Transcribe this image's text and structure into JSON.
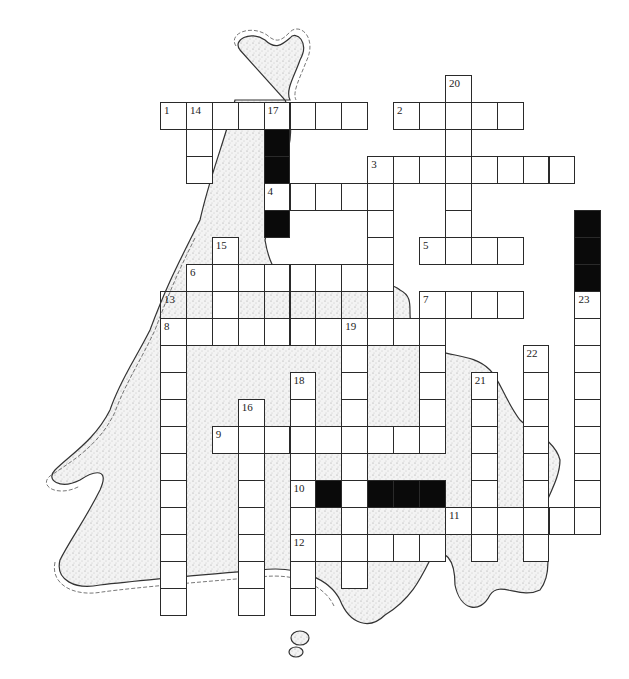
{
  "puzzle": {
    "title": "",
    "grid_origin": {
      "x": 160,
      "y": 75
    },
    "cell_w": 25.9,
    "cell_h": 27,
    "colors": {
      "line": "#2a2a2a",
      "fill": "#ffffff",
      "block": "#0a0a0a",
      "land_stipple": "#8a8a8a",
      "coast": "#333333"
    },
    "entries": [
      {
        "num": "1",
        "dir": "across",
        "r": 1,
        "c": 0,
        "len": 8
      },
      {
        "num": "2",
        "dir": "across",
        "r": 1,
        "c": 9,
        "len": 5
      },
      {
        "num": "3",
        "dir": "across",
        "r": 3,
        "c": 8,
        "len": 8
      },
      {
        "num": "4",
        "dir": "across",
        "r": 4,
        "c": 4,
        "len": 5
      },
      {
        "num": "5",
        "dir": "across",
        "r": 6,
        "c": 10,
        "len": 4
      },
      {
        "num": "6",
        "dir": "across",
        "r": 7,
        "c": 1,
        "len": 8
      },
      {
        "num": "7",
        "dir": "across",
        "r": 8,
        "c": 10,
        "len": 4
      },
      {
        "num": "8",
        "dir": "across",
        "r": 9,
        "c": 0,
        "len": 11
      },
      {
        "num": "9",
        "dir": "across",
        "r": 13,
        "c": 2,
        "len": 9
      },
      {
        "num": "10",
        "dir": "across",
        "r": 15,
        "c": 5,
        "len": 1
      },
      {
        "num": "11",
        "dir": "across",
        "r": 16,
        "c": 11,
        "len": 6
      },
      {
        "num": "12",
        "dir": "across",
        "r": 17,
        "c": 5,
        "len": 6
      },
      {
        "num": "13",
        "dir": "across",
        "r": 8,
        "c": 0,
        "len": 9,
        "open": true
      },
      {
        "num": "14",
        "dir": "down",
        "r": 1,
        "c": 1,
        "len": 3
      },
      {
        "num": "15",
        "dir": "down",
        "r": 6,
        "c": 2,
        "len": 4
      },
      {
        "num": "16",
        "dir": "down",
        "r": 12,
        "c": 3,
        "len": 8
      },
      {
        "num": "17",
        "dir": "down",
        "r": 1,
        "c": 4,
        "len": 1
      },
      {
        "num": "18",
        "dir": "down",
        "r": 11,
        "c": 5,
        "len": 9
      },
      {
        "num": "19",
        "dir": "down",
        "r": 9,
        "c": 7,
        "len": 10
      },
      {
        "num": "20",
        "dir": "down",
        "r": 0,
        "c": 11,
        "len": 7
      },
      {
        "num": "21",
        "dir": "down",
        "r": 11,
        "c": 12,
        "len": 7
      },
      {
        "num": "22",
        "dir": "down",
        "r": 10,
        "c": 14,
        "len": 8
      },
      {
        "num": "23",
        "dir": "down",
        "r": 8,
        "c": 16,
        "len": 9
      },
      {
        "num": "",
        "dir": "down",
        "r": 3,
        "c": 8,
        "len": 7
      },
      {
        "num": "",
        "dir": "down",
        "r": 9,
        "c": 0,
        "len": 11
      },
      {
        "num": "",
        "dir": "down",
        "r": 8,
        "c": 10,
        "len": 6
      },
      {
        "num": "",
        "dir": "down",
        "r": 15,
        "c": 7,
        "len": 1
      }
    ],
    "blocks": [
      {
        "r": 2,
        "c": 4
      },
      {
        "r": 3,
        "c": 4
      },
      {
        "r": 5,
        "c": 4
      },
      {
        "r": 5,
        "c": 16
      },
      {
        "r": 6,
        "c": 16
      },
      {
        "r": 7,
        "c": 16
      },
      {
        "r": 15,
        "c": 6
      },
      {
        "r": 15,
        "c": 8
      },
      {
        "r": 15,
        "c": 9
      },
      {
        "r": 15,
        "c": 10
      }
    ],
    "numbers": [
      {
        "label": "20",
        "r": 0,
        "c": 11
      },
      {
        "label": "1",
        "r": 1,
        "c": 0
      },
      {
        "label": "14",
        "r": 1,
        "c": 1
      },
      {
        "label": "17",
        "r": 1,
        "c": 4
      },
      {
        "label": "2",
        "r": 1,
        "c": 9
      },
      {
        "label": "3",
        "r": 3,
        "c": 8
      },
      {
        "label": "4",
        "r": 4,
        "c": 4
      },
      {
        "label": "15",
        "r": 6,
        "c": 2
      },
      {
        "label": "5",
        "r": 6,
        "c": 10
      },
      {
        "label": "6",
        "r": 7,
        "c": 1
      },
      {
        "label": "13",
        "r": 8,
        "c": 0
      },
      {
        "label": "7",
        "r": 8,
        "c": 10
      },
      {
        "label": "23",
        "r": 8,
        "c": 16
      },
      {
        "label": "8",
        "r": 9,
        "c": 0
      },
      {
        "label": "19",
        "r": 9,
        "c": 7
      },
      {
        "label": "22",
        "r": 10,
        "c": 14
      },
      {
        "label": "18",
        "r": 11,
        "c": 5
      },
      {
        "label": "21",
        "r": 11,
        "c": 12
      },
      {
        "label": "16",
        "r": 12,
        "c": 3
      },
      {
        "label": "9",
        "r": 13,
        "c": 2
      },
      {
        "label": "10",
        "r": 15,
        "c": 5
      },
      {
        "label": "11",
        "r": 16,
        "c": 11
      },
      {
        "label": "12",
        "r": 17,
        "c": 5
      }
    ]
  }
}
